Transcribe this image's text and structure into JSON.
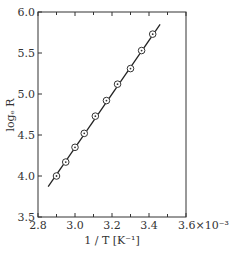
{
  "chart_data": {
    "type": "scatter",
    "title": "",
    "xlabel": "1 / T [K⁻¹]",
    "ylabel": "logₑ R",
    "x_multiplier": "×10⁻³",
    "xlim": [
      2.8,
      3.6
    ],
    "ylim": [
      3.5,
      6.0
    ],
    "x_ticks": [
      "2.8",
      "3.0",
      "3.2",
      "3.4",
      "3.6×10⁻³"
    ],
    "x_tick_values": [
      2.8,
      3.0,
      3.2,
      3.4,
      3.6
    ],
    "x_minor_ticks": [
      2.9,
      3.1,
      3.3,
      3.5
    ],
    "y_ticks": [
      "3.5",
      "4.0",
      "4.5",
      "5.0",
      "5.5",
      "6.0"
    ],
    "y_tick_values": [
      3.5,
      4.0,
      4.5,
      5.0,
      5.5,
      6.0
    ],
    "grid": false,
    "legend": null,
    "series": [
      {
        "name": "measured",
        "marker": "circle-dot",
        "x": [
          2.9,
          2.95,
          3.0,
          3.05,
          3.11,
          3.17,
          3.23,
          3.3,
          3.36,
          3.42
        ],
        "y": [
          4.0,
          4.17,
          4.35,
          4.52,
          4.73,
          4.92,
          5.12,
          5.31,
          5.53,
          5.73
        ]
      },
      {
        "name": "fit",
        "style": "line",
        "x": [
          2.855,
          3.46
        ],
        "y": [
          3.87,
          5.85
        ]
      }
    ]
  }
}
